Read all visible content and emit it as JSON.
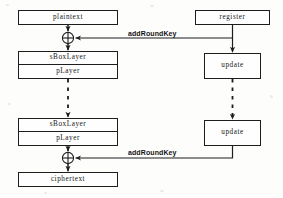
{
  "diagram": {
    "type": "flow-diagram",
    "canvas": {
      "width": 283,
      "height": 198
    },
    "colors": {
      "stroke": "#1d1d1d",
      "fill": "#fefefe",
      "background": "#fdfdfc",
      "text": "#151515"
    },
    "nodes": [
      {
        "id": "plaintext",
        "label": "plaintext",
        "shape": "rect",
        "x": 18,
        "y": 10,
        "w": 100,
        "h": 15
      },
      {
        "id": "register",
        "label": "register",
        "shape": "rect",
        "x": 195,
        "y": 10,
        "w": 75,
        "h": 15
      },
      {
        "id": "sboxlayer-1",
        "label": "sBoxLayer",
        "shape": "rect",
        "x": 18,
        "y": 51,
        "w": 100,
        "h": 14
      },
      {
        "id": "player-1",
        "label": "pLayer",
        "shape": "rect",
        "x": 18,
        "y": 65,
        "w": 100,
        "h": 14
      },
      {
        "id": "update-1",
        "label": "update",
        "shape": "rect",
        "x": 204,
        "y": 53,
        "w": 57,
        "h": 26
      },
      {
        "id": "sboxlayer-2",
        "label": "sBoxLayer",
        "shape": "rect",
        "x": 18,
        "y": 118,
        "w": 100,
        "h": 14
      },
      {
        "id": "player-2",
        "label": "pLayer",
        "shape": "rect",
        "x": 18,
        "y": 132,
        "w": 100,
        "h": 14
      },
      {
        "id": "update-2",
        "label": "update",
        "shape": "rect",
        "x": 204,
        "y": 120,
        "w": 57,
        "h": 26
      },
      {
        "id": "ciphertext",
        "label": "ciphertext",
        "shape": "rect",
        "x": 18,
        "y": 172,
        "w": 100,
        "h": 15
      }
    ],
    "operators": [
      {
        "id": "xor-top",
        "symbol": "xor",
        "cx": 68,
        "cy": 38,
        "r": 6
      },
      {
        "id": "xor-bottom",
        "symbol": "xor",
        "cx": 68,
        "cy": 158,
        "r": 6
      }
    ],
    "edges": [
      {
        "id": "plaintext-to-xor-top",
        "from": "plaintext",
        "to": "xor-top",
        "style": "solid",
        "arrow": true
      },
      {
        "id": "xor-top-to-sboxlayer-1",
        "from": "xor-top",
        "to": "sboxlayer-1",
        "style": "solid",
        "arrow": true
      },
      {
        "id": "register-to-xor-top",
        "from": "register",
        "to": "xor-top",
        "style": "solid",
        "arrow": true,
        "label": "addRoundKey"
      },
      {
        "id": "register-to-update-1",
        "from": "register",
        "to": "update-1",
        "style": "solid",
        "arrow": true
      },
      {
        "id": "player-1-to-sboxlayer-2",
        "from": "player-1",
        "to": "sboxlayer-2",
        "style": "dashed",
        "arrow": true
      },
      {
        "id": "update-1-to-update-2",
        "from": "update-1",
        "to": "update-2",
        "style": "dashed",
        "arrow": true
      },
      {
        "id": "player-2-to-xor-bottom",
        "from": "player-2",
        "to": "xor-bottom",
        "style": "solid",
        "arrow": true
      },
      {
        "id": "update-2-to-xor-bottom",
        "from": "update-2",
        "to": "xor-bottom",
        "style": "solid",
        "arrow": true,
        "label": "addRoundKey"
      },
      {
        "id": "xor-bottom-to-ciphertext",
        "from": "xor-bottom",
        "to": "ciphertext",
        "style": "solid",
        "arrow": true
      }
    ],
    "labels": {
      "addroundkey_top": "addRoundKey",
      "addroundkey_bottom": "addRoundKey"
    }
  }
}
